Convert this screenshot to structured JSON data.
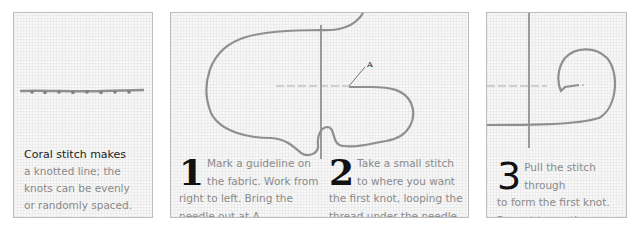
{
  "panels": [
    {
      "id": "intro",
      "caption_lead": "Coral stitch makes",
      "caption_lines": [
        "a knotted line; the",
        "knots can be evenly",
        "or randomly spaced."
      ]
    },
    {
      "id": "steps-1-2",
      "label_a": "A",
      "steps": [
        {
          "number": "1",
          "line1": "Mark a guideline on",
          "line2": "the fabric. Work from",
          "line3": "right to left. Bring the",
          "line4": "needle out at A."
        },
        {
          "number": "2",
          "line1": "Take a small stitch",
          "line2": "to where you want",
          "line3": "the first knot, looping the",
          "line4": "thread under the needle."
        }
      ]
    },
    {
      "id": "step-3",
      "steps": [
        {
          "number": "3",
          "line1": "Pull the stitch through",
          "line2": "to form the first knot.",
          "line3": "Repeat to continue."
        }
      ]
    }
  ],
  "colors": {
    "thread": "#8f8f8f",
    "needle": "#9a9a9a",
    "guideline": "#c4c4c4",
    "panel_border": "#bdbdbd"
  }
}
